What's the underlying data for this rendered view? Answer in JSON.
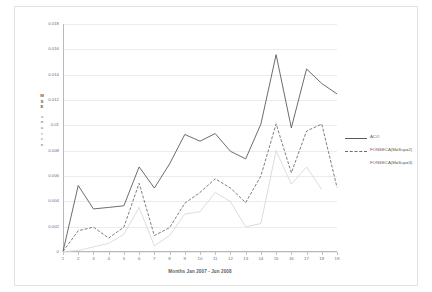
{
  "chart_data": {
    "type": "line",
    "title": "",
    "xlabel": "Months Jan 2007 - Jun 2008",
    "ylabel": "MSE source",
    "ylabel_chars": [
      "M",
      "S",
      "E",
      "s",
      "o",
      "u",
      "r",
      "c",
      "e"
    ],
    "xlim": [
      1,
      19
    ],
    "ylim": [
      0,
      0.018
    ],
    "ytick_step": 0.002,
    "grid": true,
    "legend_position": "right",
    "categories": [
      1,
      2,
      3,
      4,
      5,
      6,
      7,
      8,
      9,
      10,
      11,
      12,
      13,
      14,
      15,
      16,
      17,
      18,
      19
    ],
    "xticklabels": [
      "1",
      "2",
      "3",
      "4",
      "5",
      "6",
      "7",
      "8",
      "9",
      "10",
      "11",
      "12",
      "13",
      "14",
      "15",
      "16",
      "17",
      "18",
      "19"
    ],
    "yticklabels": [
      "0",
      "0.002",
      "0.004",
      "0.006",
      "0.008",
      "0.01",
      "0.012",
      "0.014",
      "0.016",
      "0.018"
    ],
    "ytickvalues": [
      0,
      0.002,
      0.004,
      0.006,
      0.008,
      0.01,
      0.012,
      0.014,
      0.016,
      0.018
    ],
    "series": [
      {
        "name": "ACO",
        "style": "solid",
        "color": "#5b5b5b",
        "x": [
          1,
          2,
          3,
          4,
          5,
          6,
          7,
          8,
          9,
          10,
          11,
          12,
          13,
          14,
          15,
          16,
          17,
          18,
          19
        ],
        "values": [
          5e-05,
          0.00525,
          0.0034,
          0.00352,
          0.00365,
          0.00672,
          0.00505,
          0.00695,
          0.00928,
          0.00875,
          0.00935,
          0.00795,
          0.00735,
          0.0101,
          0.01558,
          0.0098,
          0.01445,
          0.0133,
          0.01248
        ]
      },
      {
        "name": "FONSECA(M=Sup=2)",
        "style": "dashed",
        "color": "#6f6f6f",
        "x": [
          1,
          2,
          3,
          4,
          5,
          6,
          7,
          8,
          9,
          10,
          11,
          12,
          13,
          14,
          15,
          16,
          17,
          18,
          19
        ],
        "values": [
          5e-05,
          0.00168,
          0.00196,
          0.0011,
          0.00196,
          0.00543,
          0.0013,
          0.00192,
          0.00385,
          0.0047,
          0.00578,
          0.00505,
          0.0039,
          0.006,
          0.01012,
          0.00625,
          0.00955,
          0.0101,
          0.0051
        ]
      },
      {
        "name": "FONSECA(M=Sup=3)",
        "style": "solid-light",
        "color": "#d8d8d8",
        "x": [
          1,
          2,
          3,
          4,
          5,
          6,
          7,
          8,
          9,
          10,
          11,
          12,
          13,
          14,
          15,
          16,
          17,
          18
        ],
        "values": [
          2e-05,
          0.00012,
          0.0004,
          0.00068,
          0.0014,
          0.00352,
          0.00048,
          0.0013,
          0.003,
          0.00318,
          0.0047,
          0.00398,
          0.00198,
          0.00225,
          0.008,
          0.00535,
          0.00672,
          0.00492
        ]
      }
    ]
  },
  "legend": {
    "items": [
      {
        "label": "ACO"
      },
      {
        "label": "FONSECA(M=Sup=2)"
      },
      {
        "label": "FONSECA(M=Sup=3)"
      }
    ]
  }
}
